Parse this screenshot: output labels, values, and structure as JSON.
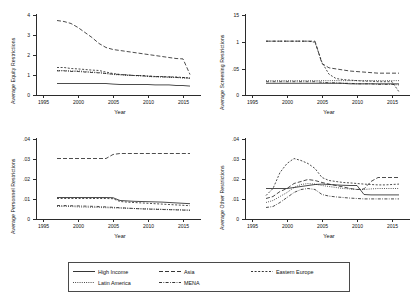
{
  "figure": {
    "legend": {
      "items": [
        {
          "label": "High Income",
          "dash": "solid"
        },
        {
          "label": "Asia",
          "dash": "dashed-long"
        },
        {
          "label": "Eastern Europe",
          "dash": "dashed-short"
        },
        {
          "label": "Latin America",
          "dash": "dotted"
        },
        {
          "label": "MENA",
          "dash": "dash-dot"
        }
      ]
    },
    "panels": [
      {
        "name": "equity-restrictions",
        "ylabel": "Average Equity Restrictions",
        "xlabel": "Year",
        "yticks": [
          "0",
          "1",
          "2",
          "3",
          "4"
        ],
        "xticks": [
          "1995",
          "2000",
          "2005",
          "2010",
          "2015"
        ]
      },
      {
        "name": "screening-restrictions",
        "ylabel": "Average Screening Restrictions",
        "xlabel": "Year",
        "yticks": [
          "0",
          ".05",
          "1",
          "15"
        ],
        "xticks": [
          "1995",
          "2000",
          "2005",
          "2010",
          "2015"
        ]
      },
      {
        "name": "personnel-restrictions",
        "ylabel": "Average Personnel Restrictions",
        "xlabel": "Year",
        "yticks": [
          "0",
          ".01",
          ".02",
          ".03",
          ".04"
        ],
        "xticks": [
          "1995",
          "2000",
          "2005",
          "2010",
          "2015"
        ]
      },
      {
        "name": "other-restrictions",
        "ylabel": "Average Other Restrictions",
        "xlabel": "Year",
        "yticks": [
          "0",
          ".01",
          ".02",
          ".03",
          ".04"
        ],
        "xticks": [
          "1995",
          "2000",
          "2005",
          "2010",
          "2015"
        ]
      }
    ]
  },
  "chart_data": [
    {
      "type": "line",
      "title": "",
      "xlabel": "Year",
      "ylabel": "Average Equity Restrictions",
      "xlim": [
        1995,
        2017
      ],
      "ylim": [
        0,
        4
      ],
      "grid": false,
      "x": [
        1997,
        1998,
        1999,
        2000,
        2001,
        2002,
        2003,
        2004,
        2005,
        2006,
        2007,
        2008,
        2009,
        2010,
        2011,
        2012,
        2013,
        2014,
        2015,
        2016
      ],
      "series": [
        {
          "name": "High Income",
          "values": [
            0.55,
            0.55,
            0.55,
            0.55,
            0.55,
            0.55,
            0.55,
            0.55,
            0.52,
            0.5,
            0.5,
            0.5,
            0.5,
            0.5,
            0.48,
            0.48,
            0.48,
            0.45,
            0.45,
            0.42
          ]
        },
        {
          "name": "Asia",
          "values": [
            3.7,
            3.65,
            3.55,
            3.35,
            3.1,
            2.85,
            2.55,
            2.35,
            2.25,
            2.2,
            2.15,
            2.1,
            2.05,
            2.0,
            1.95,
            1.9,
            1.85,
            1.8,
            1.78,
            1.0
          ]
        },
        {
          "name": "Eastern Europe",
          "values": [
            1.35,
            1.35,
            1.3,
            1.28,
            1.25,
            1.22,
            1.2,
            1.12,
            1.05,
            1.0,
            0.98,
            0.95,
            0.95,
            0.92,
            0.9,
            0.9,
            0.88,
            0.88,
            0.85,
            0.83
          ]
        },
        {
          "name": "Latin America",
          "values": [
            1.2,
            1.2,
            1.18,
            1.18,
            1.15,
            1.12,
            1.1,
            1.05,
            1.0,
            0.98,
            0.95,
            0.95,
            0.92,
            0.9,
            0.88,
            0.88,
            0.85,
            0.85,
            0.82,
            0.8
          ]
        },
        {
          "name": "MENA",
          "values": [
            1.18,
            1.18,
            1.15,
            1.15,
            1.12,
            1.1,
            1.08,
            1.05,
            1.02,
            1.0,
            0.98,
            0.95,
            0.95,
            0.92,
            0.9,
            0.88,
            0.88,
            0.85,
            0.85,
            0.82
          ]
        }
      ]
    },
    {
      "type": "line",
      "title": "",
      "xlabel": "Year",
      "ylabel": "Average Screening Restrictions",
      "xlim": [
        1995,
        2017
      ],
      "ylim": [
        0,
        0.15
      ],
      "grid": false,
      "x": [
        1997,
        1998,
        1999,
        2000,
        2001,
        2002,
        2003,
        2004,
        2005,
        2006,
        2007,
        2008,
        2009,
        2010,
        2011,
        2012,
        2013,
        2014,
        2015,
        2016
      ],
      "series": [
        {
          "name": "High Income",
          "values": [
            0.021,
            0.021,
            0.021,
            0.021,
            0.021,
            0.021,
            0.021,
            0.021,
            0.021,
            0.021,
            0.021,
            0.021,
            0.02,
            0.02,
            0.02,
            0.02,
            0.02,
            0.02,
            0.02,
            0.02
          ]
        },
        {
          "name": "Asia",
          "values": [
            0.1,
            0.1,
            0.1,
            0.1,
            0.1,
            0.1,
            0.1,
            0.1,
            0.058,
            0.05,
            0.048,
            0.046,
            0.044,
            0.043,
            0.042,
            0.041,
            0.04,
            0.04,
            0.04,
            0.04
          ]
        },
        {
          "name": "Eastern Europe",
          "values": [
            0.1,
            0.1,
            0.1,
            0.1,
            0.1,
            0.1,
            0.1,
            0.098,
            0.06,
            0.038,
            0.03,
            0.028,
            0.027,
            0.026,
            0.025,
            0.025,
            0.024,
            0.024,
            0.024,
            0.005
          ]
        },
        {
          "name": "Latin America",
          "values": [
            0.026,
            0.026,
            0.026,
            0.026,
            0.026,
            0.026,
            0.026,
            0.026,
            0.026,
            0.026,
            0.026,
            0.026,
            0.026,
            0.026,
            0.026,
            0.026,
            0.026,
            0.026,
            0.026,
            0.026
          ]
        },
        {
          "name": "MENA",
          "values": [
            0.024,
            0.024,
            0.024,
            0.024,
            0.024,
            0.024,
            0.024,
            0.024,
            0.023,
            0.022,
            0.022,
            0.021,
            0.021,
            0.02,
            0.02,
            0.02,
            0.019,
            0.019,
            0.019,
            0.018
          ]
        }
      ]
    },
    {
      "type": "line",
      "title": "",
      "xlabel": "Year",
      "ylabel": "Average Personnel Restrictions",
      "xlim": [
        1995,
        2017
      ],
      "ylim": [
        0,
        0.04
      ],
      "grid": false,
      "x": [
        1997,
        1998,
        1999,
        2000,
        2001,
        2002,
        2003,
        2004,
        2005,
        2006,
        2007,
        2008,
        2009,
        2010,
        2011,
        2012,
        2013,
        2014,
        2015,
        2016
      ],
      "series": [
        {
          "name": "High Income",
          "values": [
            0.0105,
            0.0105,
            0.0105,
            0.0105,
            0.0105,
            0.0105,
            0.0105,
            0.0105,
            0.0104,
            0.009,
            0.0088,
            0.0086,
            0.0085,
            0.0084,
            0.0083,
            0.0082,
            0.008,
            0.0078,
            0.0076,
            0.0074
          ]
        },
        {
          "name": "Asia",
          "values": [
            0.03,
            0.03,
            0.03,
            0.03,
            0.03,
            0.03,
            0.03,
            0.03,
            0.032,
            0.0325,
            0.0325,
            0.0325,
            0.0325,
            0.0325,
            0.0325,
            0.0325,
            0.0325,
            0.0325,
            0.0325,
            0.0325
          ]
        },
        {
          "name": "Eastern Europe",
          "values": [
            0.01,
            0.01,
            0.01,
            0.01,
            0.01,
            0.01,
            0.01,
            0.01,
            0.0099,
            0.0085,
            0.0082,
            0.008,
            0.0078,
            0.0076,
            0.0074,
            0.0072,
            0.007,
            0.0068,
            0.0066,
            0.0064
          ]
        },
        {
          "name": "Latin America",
          "values": [
            0.006,
            0.006,
            0.006,
            0.0058,
            0.0057,
            0.0056,
            0.0055,
            0.0054,
            0.0053,
            0.0052,
            0.0051,
            0.005,
            0.0049,
            0.0048,
            0.0047,
            0.0046,
            0.0045,
            0.0044,
            0.0043,
            0.0042
          ]
        },
        {
          "name": "MENA",
          "values": [
            0.0065,
            0.0065,
            0.0064,
            0.0063,
            0.0062,
            0.0061,
            0.006,
            0.0058,
            0.0056,
            0.0054,
            0.0052,
            0.005,
            0.0048,
            0.0047,
            0.0046,
            0.0045,
            0.0044,
            0.0043,
            0.0042,
            0.0041
          ]
        }
      ]
    },
    {
      "type": "line",
      "title": "",
      "xlabel": "Year",
      "ylabel": "Average Other Restrictions",
      "xlim": [
        1995,
        2017
      ],
      "ylim": [
        0,
        0.04
      ],
      "grid": false,
      "x": [
        1997,
        1998,
        1999,
        2000,
        2001,
        2002,
        2003,
        2004,
        2005,
        2006,
        2007,
        2008,
        2009,
        2010,
        2011,
        2012,
        2013,
        2014,
        2015,
        2016
      ],
      "series": [
        {
          "name": "High Income",
          "values": [
            0.015,
            0.015,
            0.015,
            0.015,
            0.0155,
            0.016,
            0.0165,
            0.017,
            0.0172,
            0.017,
            0.0168,
            0.0166,
            0.0165,
            0.0165,
            0.012,
            0.0118,
            0.0118,
            0.0118,
            0.0118,
            0.0118
          ]
        },
        {
          "name": "Asia",
          "values": [
            0.01,
            0.011,
            0.0135,
            0.015,
            0.0175,
            0.0185,
            0.0195,
            0.019,
            0.018,
            0.0172,
            0.0165,
            0.0158,
            0.015,
            0.0145,
            0.0148,
            0.0185,
            0.0205,
            0.0205,
            0.0205,
            0.0205
          ]
        },
        {
          "name": "Eastern Europe",
          "values": [
            0.0115,
            0.015,
            0.023,
            0.0275,
            0.03,
            0.029,
            0.0275,
            0.025,
            0.0205,
            0.019,
            0.0185,
            0.018,
            0.0178,
            0.0175,
            0.0172,
            0.017,
            0.0168,
            0.0168,
            0.017,
            0.0172
          ]
        },
        {
          "name": "Latin America",
          "values": [
            0.008,
            0.009,
            0.011,
            0.013,
            0.0155,
            0.017,
            0.0175,
            0.0172,
            0.0165,
            0.016,
            0.0155,
            0.015,
            0.0148,
            0.0145,
            0.0145,
            0.0148,
            0.015,
            0.015,
            0.015,
            0.015
          ]
        },
        {
          "name": "MENA",
          "values": [
            0.0055,
            0.006,
            0.008,
            0.0105,
            0.013,
            0.0145,
            0.015,
            0.0145,
            0.012,
            0.0112,
            0.0108,
            0.0105,
            0.0102,
            0.01,
            0.0098,
            0.0098,
            0.0098,
            0.0098,
            0.0098,
            0.0098
          ]
        }
      ]
    }
  ]
}
